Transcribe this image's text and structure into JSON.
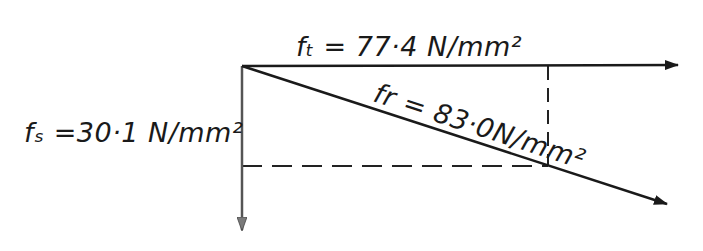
{
  "diagram": {
    "colors": {
      "line": "#1a1a1a",
      "dashed": "#222222",
      "vertical_arrow": "#555555",
      "background": "#ffffff"
    },
    "origin": {
      "x": 242,
      "y": 66
    },
    "vectors": [
      {
        "id": "ft",
        "symbol": "ft",
        "value": "77.4",
        "unit": "N/mm²",
        "label": "ft = 77·4 N/mm²",
        "direction": "horizontal-right",
        "end": {
          "x": 678,
          "y": 65
        }
      },
      {
        "id": "fs",
        "symbol": "fs",
        "value": "30.1",
        "unit": "N/mm²",
        "label": "fs = 30·1 N/mm²",
        "direction": "vertical-down",
        "end": {
          "x": 242,
          "y": 230
        }
      },
      {
        "id": "fr",
        "symbol": "fr",
        "value": "83.0",
        "unit": "N/mm²",
        "label": "fr = 83·0 N/mm²",
        "direction": "diagonal-down-right",
        "end": {
          "x": 667,
          "y": 204
        }
      }
    ],
    "construction_lines": [
      {
        "id": "dashed-vertical",
        "from": {
          "x": 548,
          "y": 66
        },
        "to": {
          "x": 548,
          "y": 166
        }
      },
      {
        "id": "dashed-horizontal",
        "from": {
          "x": 242,
          "y": 166
        },
        "to": {
          "x": 548,
          "y": 166
        }
      }
    ]
  },
  "labels": {
    "ft": "fₜ = 77·4 N/mm²",
    "fs": "fₛ =30·1 N/mm²",
    "fr": "fr = 83·0N/mm²"
  }
}
